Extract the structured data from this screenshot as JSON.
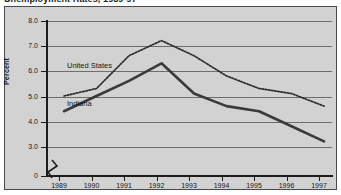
{
  "figure": {
    "title": "Unemployment Rates, 1989-97",
    "background_color": "#d2d2d2",
    "border_color": "#4a4a4a"
  },
  "chart_data": {
    "type": "line",
    "title": "Unemployment Rates, 1989-97",
    "xlabel": "",
    "ylabel": "Percent",
    "x": [
      1989,
      1990,
      1991,
      1992,
      1993,
      1994,
      1995,
      1996,
      1997
    ],
    "categories": [
      "1989",
      "1990",
      "1991",
      "1992",
      "1993",
      "1994",
      "1995",
      "1996",
      "1997"
    ],
    "ylim": [
      3.0,
      8.0
    ],
    "y_axis_break": true,
    "y_break_value": "0",
    "yticks": [
      "8.0",
      "7.0",
      "6.0",
      "5.0",
      "4.0",
      "3.0",
      "0"
    ],
    "ytick_values": [
      8.0,
      7.0,
      6.0,
      5.0,
      4.0,
      3.0
    ],
    "grid": true,
    "legend": "in-plot annotations",
    "series": [
      {
        "name": "United States",
        "style": "dotted",
        "color": "#2b2b2b",
        "values": [
          5.3,
          5.6,
          6.9,
          7.5,
          6.9,
          6.1,
          5.6,
          5.4,
          4.9
        ]
      },
      {
        "name": "Indiana",
        "style": "solid",
        "color": "#3a3a3a",
        "values": [
          4.7,
          5.3,
          5.9,
          6.6,
          5.4,
          4.9,
          4.7,
          4.1,
          3.5
        ]
      }
    ]
  },
  "axis": {
    "y_title": "Percent",
    "ytick_labels": [
      "8.0",
      "7.0",
      "6.0",
      "5.0",
      "4.0",
      "3.0",
      "0"
    ],
    "xtick_labels": [
      "1989",
      "1990",
      "1991",
      "1992",
      "1993",
      "1994",
      "1995",
      "1996",
      "1997"
    ]
  },
  "annotations": {
    "united_states": "United States",
    "indiana": "Indiana"
  }
}
